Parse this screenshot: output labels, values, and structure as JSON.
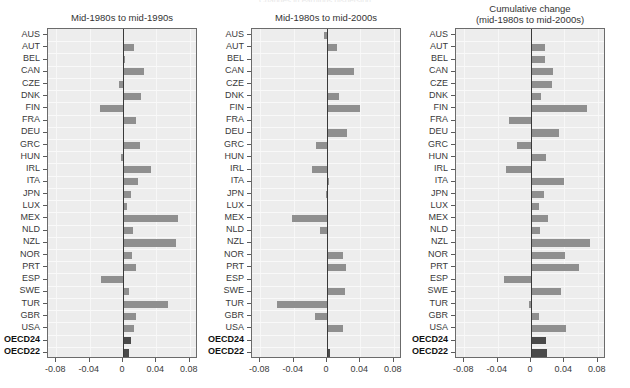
{
  "figure": {
    "suptitle_cropped": "Changes in earnings dispersion",
    "axis_ticks": [
      "-0.08",
      "-0.04",
      "0",
      "0.04",
      "0.08"
    ],
    "axis_tick_values": [
      -0.08,
      -0.04,
      0,
      0.04,
      0.08
    ],
    "xlim": [
      -0.09,
      0.09
    ],
    "bar_color": "#8f8f8f",
    "aggregate_bar_color": "#4a4a4a",
    "panel_bg": "#ededed",
    "zero_line_color": "#3a3a3a",
    "categories": [
      "AUS",
      "AUT",
      "BEL",
      "CAN",
      "CZE",
      "DNK",
      "FIN",
      "FRA",
      "DEU",
      "GRC",
      "HUN",
      "IRL",
      "ITA",
      "JPN",
      "LUX",
      "MEX",
      "NLD",
      "NZL",
      "NOR",
      "PRT",
      "ESP",
      "SWE",
      "TUR",
      "GBR",
      "USA",
      "OECD24",
      "OECD22"
    ],
    "aggregate_rows": [
      "OECD24",
      "OECD22"
    ]
  },
  "chart_data": [
    {
      "type": "bar",
      "orientation": "horizontal",
      "title": "Mid-1980s to mid-1990s",
      "xlabel": "",
      "ylabel": "",
      "xlim": [
        -0.09,
        0.09
      ],
      "grid": true,
      "legend": "none",
      "categories": [
        "AUS",
        "AUT",
        "BEL",
        "CAN",
        "CZE",
        "DNK",
        "FIN",
        "FRA",
        "DEU",
        "GRC",
        "HUN",
        "IRL",
        "ITA",
        "JPN",
        "LUX",
        "MEX",
        "NLD",
        "NZL",
        "NOR",
        "PRT",
        "ESP",
        "SWE",
        "TUR",
        "GBR",
        "USA",
        "OECD24",
        "OECD22"
      ],
      "values": [
        0.0,
        0.013,
        0.002,
        0.025,
        -0.005,
        0.021,
        -0.028,
        0.015,
        0.0,
        0.02,
        -0.003,
        0.034,
        0.018,
        0.01,
        0.005,
        0.066,
        0.012,
        0.063,
        0.011,
        0.016,
        -0.027,
        0.007,
        0.054,
        0.015,
        0.013,
        0.009,
        0.007
      ]
    },
    {
      "type": "bar",
      "orientation": "horizontal",
      "title": "Mid-1980s to mid-2000s",
      "xlabel": "",
      "ylabel": "",
      "xlim": [
        -0.09,
        0.09
      ],
      "grid": true,
      "legend": "none",
      "categories": [
        "AUS",
        "AUT",
        "BEL",
        "CAN",
        "CZE",
        "DNK",
        "FIN",
        "FRA",
        "DEU",
        "GRC",
        "HUN",
        "IRL",
        "ITA",
        "JPN",
        "LUX",
        "MEX",
        "NLD",
        "NZL",
        "NOR",
        "PRT",
        "ESP",
        "SWE",
        "TUR",
        "GBR",
        "USA",
        "OECD24",
        "OECD22"
      ],
      "values": [
        -0.004,
        0.012,
        0.001,
        0.032,
        0.001,
        0.014,
        0.04,
        0.0,
        0.024,
        -0.013,
        0.001,
        -0.018,
        0.002,
        -0.001,
        0.0,
        -0.042,
        -0.008,
        0.0,
        0.019,
        0.023,
        0.0,
        0.021,
        -0.06,
        -0.015,
        0.019,
        0.001,
        0.004
      ]
    },
    {
      "type": "bar",
      "orientation": "horizontal",
      "title": "Cumulative change\n(mid-1980s to mid-2000s)",
      "xlabel": "",
      "ylabel": "",
      "xlim": [
        -0.09,
        0.09
      ],
      "grid": true,
      "legend": "none",
      "categories": [
        "AUS",
        "AUT",
        "BEL",
        "CAN",
        "CZE",
        "DNK",
        "FIN",
        "FRA",
        "DEU",
        "GRC",
        "HUN",
        "IRL",
        "ITA",
        "JPN",
        "LUX",
        "MEX",
        "NLD",
        "NZL",
        "NOR",
        "PRT",
        "ESP",
        "SWE",
        "TUR",
        "GBR",
        "USA",
        "OECD24",
        "OECD22"
      ],
      "values": [
        0.0,
        0.017,
        0.017,
        0.026,
        0.025,
        0.012,
        0.067,
        -0.027,
        0.034,
        -0.017,
        0.018,
        -0.03,
        0.04,
        0.015,
        0.01,
        0.02,
        0.011,
        0.071,
        0.041,
        0.057,
        -0.033,
        0.036,
        -0.003,
        0.009,
        0.042,
        0.018,
        0.019
      ]
    }
  ]
}
